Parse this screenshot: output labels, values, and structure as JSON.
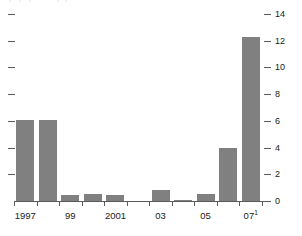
{
  "chart_data": {
    "type": "bar",
    "title": "",
    "subtitle": "",
    "xlabel": "",
    "ylabel": "",
    "categories": [
      "1997",
      "1998",
      "1999",
      "2000",
      "2001",
      "2002",
      "2003",
      "2004",
      "2005",
      "2006",
      "2007"
    ],
    "values": [
      6.1,
      6.1,
      0.45,
      0.55,
      0.45,
      0.0,
      0.8,
      0.1,
      0.55,
      4.0,
      12.3
    ],
    "series": [
      {
        "name": "",
        "values": [
          6.1,
          6.1,
          0.45,
          0.55,
          0.45,
          0.0,
          0.8,
          0.1,
          0.55,
          4.0,
          12.3
        ]
      }
    ],
    "ylim": [
      0,
      14
    ],
    "y_ticks": [
      0,
      2,
      4,
      6,
      8,
      10,
      12,
      14
    ],
    "y_tick_labels": [
      "0",
      "2",
      "4",
      "6",
      "8",
      "10",
      "12",
      "14"
    ],
    "y_axis_position": "right",
    "left_axis_ticks_unlabeled": true,
    "x_tick_labels": [
      {
        "text": "1997",
        "footnote": "",
        "category": "1997"
      },
      {
        "text": "99",
        "footnote": "",
        "category": "1999"
      },
      {
        "text": "2001",
        "footnote": "",
        "category": "2001"
      },
      {
        "text": "03",
        "footnote": "",
        "category": "2003"
      },
      {
        "text": "05",
        "footnote": "",
        "category": "2005"
      },
      {
        "text": "07",
        "footnote": "1",
        "category": "2007"
      }
    ],
    "grid": false,
    "legend": null,
    "bar_color": "#808080",
    "axis_color": "#5a5a5a",
    "text_color": "#1a1a1a",
    "background_color": "#ffffff"
  }
}
